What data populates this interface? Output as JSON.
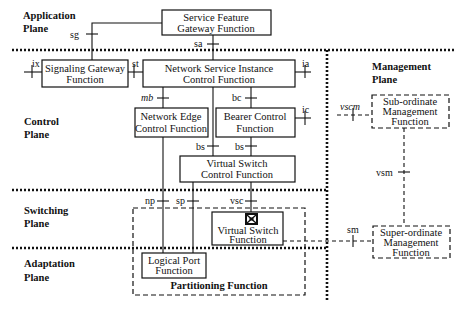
{
  "planes": {
    "application": [
      "Application",
      "Plane"
    ],
    "control": [
      "Control",
      "Plane"
    ],
    "switching": [
      "Switching",
      "Plane"
    ],
    "adaptation": [
      "Adaptation",
      "Plane"
    ],
    "management": [
      "Management",
      "Plane"
    ]
  },
  "functions": {
    "service_feature_gateway": [
      "Service Feature",
      "Gateway Function"
    ],
    "signaling_gateway": [
      "Signaling Gateway",
      "Function"
    ],
    "network_service_instance": [
      "Network Service Instance",
      "Control Function"
    ],
    "network_edge_control": [
      "Network Edge",
      "Control Function"
    ],
    "bearer_control": [
      "Bearer Control",
      "Function"
    ],
    "virtual_switch_control": [
      "Virtual Switch",
      "Control Function"
    ],
    "virtual_switch": [
      "Virtual Switch",
      "Function"
    ],
    "logical_port": [
      "Logical Port",
      "Function"
    ],
    "partitioning": "Partitioning Function",
    "sub_ordinate_management": [
      "Sub-ordinate",
      "Management",
      "Function"
    ],
    "super_ordinate_management": [
      "Super-ordinate",
      "Management",
      "Function"
    ]
  },
  "interfaces": {
    "sg": "sg",
    "sa": "sa",
    "ix": "ix",
    "st": "st",
    "ia": "ia",
    "mb": "mb",
    "bc": "bc",
    "ic": "ic",
    "bs_left": "bs",
    "bs_right": "bs",
    "np": "np",
    "sp": "sp",
    "vsc": "vsc",
    "vscm": "vscm",
    "vsm": "vsm",
    "sm": "sm"
  },
  "icons": {
    "virtual_switch": "switch-icon"
  }
}
